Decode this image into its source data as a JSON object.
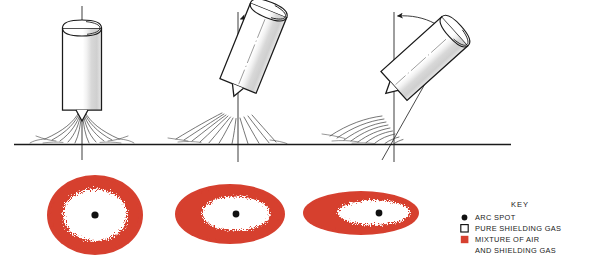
{
  "figure": {
    "ground_line_label": "workpiece-surface"
  },
  "colors": {
    "ink": "#1a1a1a",
    "line": "#2b2b2b",
    "gas_red": "#d6402f",
    "gas_red_soft": "#dc5442",
    "shading": "#c9c9c9",
    "background": "#ffffff",
    "white": "#ffffff"
  },
  "torches": [
    {
      "id": "torch-vertical",
      "angle_deg": 0,
      "label": "vertical torch",
      "spot_pattern": "circular-annulus"
    },
    {
      "id": "torch-tilted-moderate",
      "angle_deg": 22,
      "label": "moderately inclined torch",
      "spot_pattern": "oval"
    },
    {
      "id": "torch-tilted-steep",
      "angle_deg": 48,
      "label": "steeply inclined torch",
      "spot_pattern": "elongated-oval"
    }
  ],
  "spots": [
    {
      "id": "spot-circular",
      "shape": "circle",
      "rx": 48,
      "ry": 40,
      "cx": 95,
      "cy": 215,
      "core_rx": 32,
      "core_ry": 26,
      "dot_cx": 95,
      "dot_cy": 215
    },
    {
      "id": "spot-oval",
      "shape": "ellipse",
      "rx": 55,
      "ry": 30,
      "cx": 230,
      "cy": 214,
      "core_rx": 34,
      "core_ry": 17,
      "dot_cx": 235,
      "dot_cy": 214
    },
    {
      "id": "spot-elongated",
      "shape": "ellipse",
      "rx": 58,
      "ry": 22,
      "cx": 361,
      "cy": 213,
      "core_rx": 34,
      "core_ry": 13,
      "dot_cx": 379,
      "dot_cy": 213
    }
  ],
  "key": {
    "title": "KEY",
    "items": [
      {
        "marker": "black-dot",
        "label": "ARC SPOT"
      },
      {
        "marker": "white-square",
        "label": "PURE SHIELDING GAS"
      },
      {
        "marker": "red-square",
        "label": "MIXTURE OF AIR"
      },
      {
        "marker": "none",
        "label": "AND SHIELDING GAS"
      }
    ]
  }
}
